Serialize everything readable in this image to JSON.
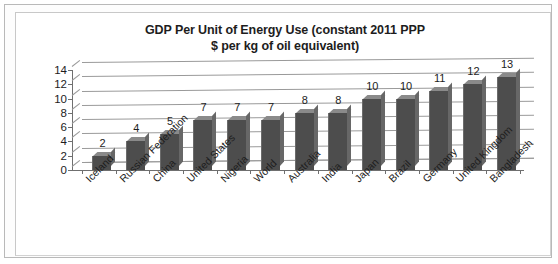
{
  "chart_data": {
    "type": "bar",
    "title": "GDP Per Unit of Energy Use (constant 2011 PPP $ per kg of oil equivalent)",
    "title_lines": [
      "GDP Per Unit of Energy Use (constant 2011 PPP",
      "$ per kg of oil equivalent)"
    ],
    "categories": [
      "Iceland",
      "Russian Federation",
      "China",
      "United States",
      "Nigeria",
      "World",
      "Australia",
      "India",
      "Japan",
      "Brazil",
      "Germany",
      "United Kingdom",
      "Bangladesh"
    ],
    "values": [
      2,
      4,
      5,
      7,
      7,
      7,
      8,
      8,
      10,
      10,
      11,
      12,
      13
    ],
    "xlabel": "",
    "ylabel": "",
    "ylim": [
      0,
      14
    ],
    "yticks": [
      0,
      2,
      4,
      6,
      8,
      10,
      12,
      14
    ],
    "grid": true,
    "legend": false,
    "style": "3d-column",
    "bar_color": "#4d4d4d",
    "gridline_color": "#9a9a9a",
    "text_color": "#1d1d1d",
    "background_color": "#ffffff"
  }
}
